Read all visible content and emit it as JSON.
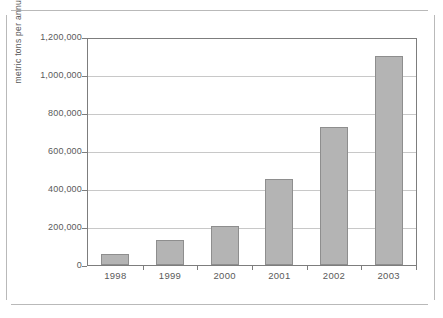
{
  "chart_data": {
    "type": "bar",
    "title": "",
    "xlabel": "",
    "ylabel": "metric tons per annum",
    "categories": [
      "1998",
      "1999",
      "2000",
      "2001",
      "2002",
      "2003"
    ],
    "values": [
      56000,
      135000,
      209000,
      456000,
      735000,
      1109000
    ],
    "ylim": [
      0,
      1200000
    ],
    "ytick_values": [
      0,
      200000,
      400000,
      600000,
      800000,
      1000000,
      1200000
    ],
    "ytick_labels": [
      "0",
      "200,000",
      "400,000",
      "600,000",
      "800,000",
      "1,000,000",
      "1,200,000"
    ],
    "grid": true,
    "legend": false,
    "legend_position": "none",
    "series": [
      {
        "name": "metric tons per annum",
        "values": [
          56000,
          135000,
          209000,
          456000,
          735000,
          1109000
        ]
      }
    ],
    "colors": {
      "bar_fill": "#b4b4b4",
      "bar_border": "#8e8e8e",
      "gridline": "#c8c8c8",
      "axis": "#7d7d7d",
      "text": "#5a5a5a",
      "frame": "#b9b9b9",
      "background": "#ffffff"
    }
  }
}
